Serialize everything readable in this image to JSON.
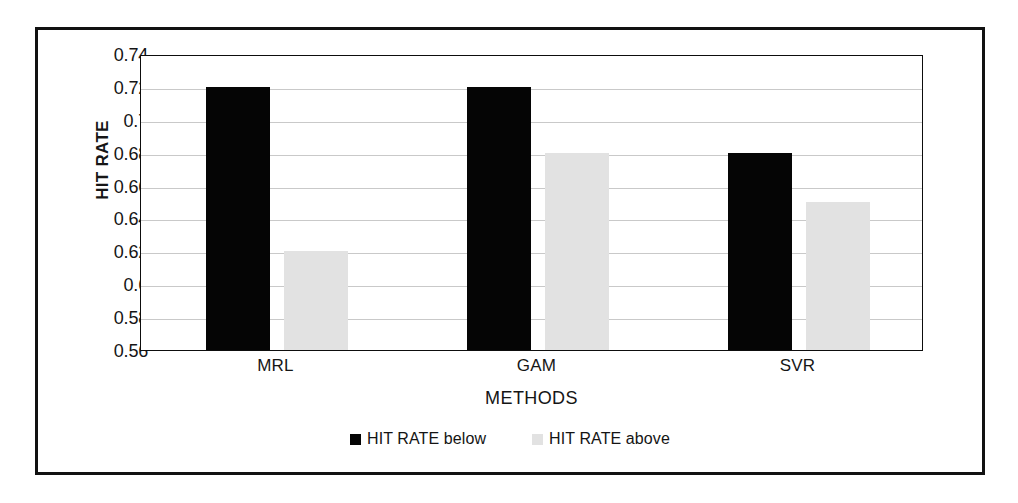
{
  "chart_data": {
    "type": "bar",
    "title": "",
    "xlabel": "METHODS",
    "ylabel": "HIT RATE",
    "categories": [
      "MRL",
      "GAM",
      "SVR"
    ],
    "series": [
      {
        "name": "HIT RATE below",
        "color": "#050505",
        "values": [
          0.72,
          0.72,
          0.68
        ]
      },
      {
        "name": "HIT RATE above",
        "color": "#e2e2e2",
        "values": [
          0.62,
          0.68,
          0.65
        ]
      }
    ],
    "ylim": [
      0.56,
      0.74
    ],
    "ytick_step": 0.02,
    "ytick_labels": [
      "0.74",
      "0.72",
      "0.7",
      "0.68",
      "0.66",
      "0.64",
      "0.62",
      "0.6",
      "0.58",
      "0.56"
    ],
    "ytick_values": [
      0.74,
      0.72,
      0.7,
      0.68,
      0.66,
      0.64,
      0.62,
      0.6,
      0.58,
      0.56
    ],
    "grid": true,
    "legend_position": "bottom"
  }
}
